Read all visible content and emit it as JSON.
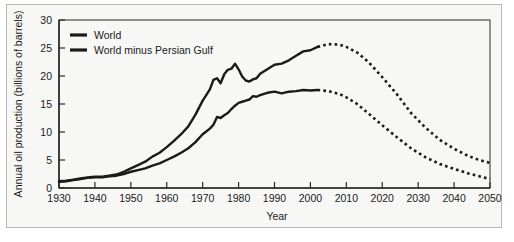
{
  "chart_data": {
    "type": "line",
    "title": "",
    "xlabel": "Year",
    "ylabel": "Annual oil production (billions of barrels)",
    "xlim": [
      1930,
      2050
    ],
    "ylim": [
      0,
      30
    ],
    "xticks": [
      1930,
      1940,
      1950,
      1960,
      1970,
      1980,
      1990,
      2000,
      2010,
      2020,
      2030,
      2040,
      2050
    ],
    "yticks": [
      0,
      5,
      10,
      15,
      20,
      25,
      30
    ],
    "grid": false,
    "legend_position": "top-left",
    "series": [
      {
        "name": "World",
        "color": "#1a1a1a",
        "history_style": "solid",
        "projection_style": "dotted",
        "projection_start_year": 2002,
        "x": [
          1930,
          1932,
          1934,
          1936,
          1938,
          1940,
          1942,
          1944,
          1946,
          1948,
          1950,
          1952,
          1954,
          1956,
          1958,
          1960,
          1962,
          1964,
          1966,
          1968,
          1970,
          1971,
          1972,
          1973,
          1974,
          1975,
          1976,
          1977,
          1978,
          1979,
          1980,
          1981,
          1982,
          1983,
          1984,
          1985,
          1986,
          1988,
          1990,
          1992,
          1994,
          1996,
          1998,
          2000,
          2002,
          2005,
          2008,
          2010,
          2013,
          2016,
          2020,
          2024,
          2028,
          2032,
          2036,
          2040,
          2044,
          2047,
          2050
        ],
        "y": [
          1.2,
          1.3,
          1.5,
          1.7,
          1.9,
          2.0,
          2.0,
          2.2,
          2.4,
          2.9,
          3.5,
          4.1,
          4.7,
          5.6,
          6.3,
          7.3,
          8.4,
          9.6,
          11.0,
          13.1,
          15.6,
          16.6,
          17.6,
          19.3,
          19.6,
          18.7,
          20.3,
          21.1,
          21.3,
          22.2,
          21.2,
          19.9,
          19.2,
          19.0,
          19.4,
          19.6,
          20.4,
          21.2,
          22.0,
          22.2,
          22.8,
          23.6,
          24.4,
          24.6,
          25.2,
          25.7,
          25.6,
          25.2,
          24.2,
          22.6,
          19.8,
          16.8,
          13.4,
          10.8,
          8.6,
          7.0,
          5.7,
          5.0,
          4.5
        ]
      },
      {
        "name": "World minus Persian Gulf",
        "color": "#1a1a1a",
        "history_style": "solid",
        "projection_style": "dotted",
        "projection_start_year": 2002,
        "x": [
          1930,
          1932,
          1934,
          1936,
          1938,
          1940,
          1942,
          1944,
          1946,
          1948,
          1950,
          1952,
          1954,
          1956,
          1958,
          1960,
          1962,
          1964,
          1966,
          1968,
          1970,
          1971,
          1972,
          1973,
          1974,
          1975,
          1976,
          1977,
          1978,
          1979,
          1980,
          1981,
          1982,
          1983,
          1984,
          1985,
          1986,
          1988,
          1990,
          1992,
          1994,
          1996,
          1998,
          2000,
          2002,
          2005,
          2008,
          2010,
          2013,
          2016,
          2020,
          2024,
          2028,
          2032,
          2036,
          2040,
          2044,
          2047,
          2050
        ],
        "y": [
          1.1,
          1.2,
          1.4,
          1.6,
          1.8,
          1.9,
          1.9,
          2.1,
          2.2,
          2.5,
          2.9,
          3.2,
          3.5,
          4.0,
          4.4,
          5.0,
          5.6,
          6.3,
          7.1,
          8.2,
          9.6,
          10.1,
          10.6,
          11.3,
          12.7,
          12.5,
          13.0,
          13.4,
          14.1,
          14.7,
          15.2,
          15.4,
          15.6,
          15.8,
          16.4,
          16.3,
          16.6,
          17.0,
          17.2,
          16.9,
          17.2,
          17.3,
          17.5,
          17.4,
          17.5,
          17.3,
          16.8,
          16.2,
          15.0,
          13.4,
          11.2,
          9.1,
          7.1,
          5.5,
          4.3,
          3.4,
          2.6,
          2.1,
          1.6
        ]
      }
    ]
  },
  "legend": {
    "items": [
      {
        "label": "World"
      },
      {
        "label": "World minus Persian Gulf"
      }
    ]
  },
  "axes": {
    "y_title": "Annual oil production (billions of barrels)",
    "x_title": "Year"
  },
  "colors": {
    "line": "#1a1a1a",
    "axis": "#2a2a2a",
    "frame": "#b8b8b8",
    "background": "#f7f7f5"
  }
}
